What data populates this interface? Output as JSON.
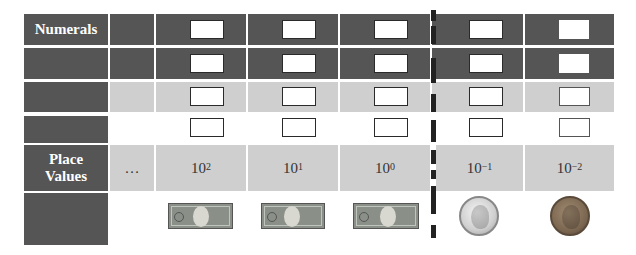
{
  "diagram": {
    "row_labels": {
      "numerals": "Numerals",
      "place_values": "Place Values"
    },
    "ellipsis": "…",
    "place_values": [
      {
        "base": "10",
        "exponent": "2"
      },
      {
        "base": "10",
        "exponent": "1"
      },
      {
        "base": "10",
        "exponent": "0"
      },
      {
        "base": "10",
        "exponent": "−1"
      },
      {
        "base": "10",
        "exponent": "−2"
      }
    ],
    "money_icons": [
      "hundred-dollar-bill",
      "ten-dollar-bill",
      "one-dollar-bill",
      "dime",
      "penny"
    ],
    "decimal_point_divider": "dashed-line",
    "colors": {
      "dark_fill": "#555555",
      "light_fill": "#cfcfcf",
      "divider": "#222222"
    }
  }
}
